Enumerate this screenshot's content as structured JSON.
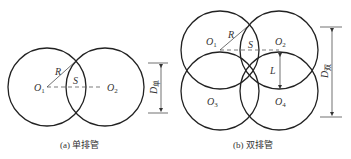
{
  "diagrams": [
    {
      "id": "single-row",
      "caption": "(a) 单排管",
      "centers": [
        "O",
        "O"
      ],
      "center_subscripts": [
        "1",
        "2"
      ],
      "radius_label": "R",
      "overlap_label": "S",
      "dimension_label": "D",
      "dimension_subscript": "单"
    },
    {
      "id": "double-row",
      "caption": "(b) 双排管",
      "centers": [
        "O",
        "O",
        "O",
        "O"
      ],
      "center_subscripts": [
        "1",
        "2",
        "3",
        "4"
      ],
      "radius_label": "R",
      "overlap_label": "S",
      "row_spacing_label": "L",
      "dimension_label": "D",
      "dimension_subscript": "双"
    }
  ]
}
